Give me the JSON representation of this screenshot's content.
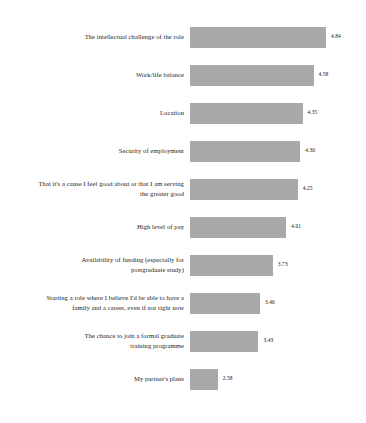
{
  "chart_data": {
    "type": "bar",
    "orientation": "horizontal",
    "title": "",
    "subtitle": "",
    "xlabel": "",
    "ylabel": "",
    "grid": false,
    "legend": null,
    "axis_visible": false,
    "tick_labels": [],
    "value_label_format": "2dp",
    "xlim": [
      2.0,
      5.0
    ],
    "bar_color": "#a9a9a9",
    "label_color": "#1c1c1c",
    "value_color": "#111111",
    "background": "#ffffff",
    "categories": [
      "The intellectual challenge of the role",
      "Work/life balance",
      "Location",
      "Security of employment",
      "That it's a cause I feel good about or that I am serving\nthe greater good",
      "High level of pay",
      "Availability of funding (especially for\npostgraduate study)",
      "Starting a role where I believe I'd be able to have a\nfamily and a career, even if not right now",
      "The chance to join a formal graduate\ntraining programme",
      "My partner's plans"
    ],
    "values": [
      4.84,
      4.58,
      4.35,
      4.3,
      4.25,
      4.01,
      3.73,
      3.46,
      3.43,
      2.58
    ],
    "value_labels": [
      "4.84",
      "4.58",
      "4.35",
      "4.30",
      "4.25",
      "4.01",
      "3.73",
      "3.46",
      "3.43",
      "2.58"
    ],
    "bars": [
      {
        "label": "The intellectual challenge of the role",
        "value": 4.84,
        "value_label": "4.84"
      },
      {
        "label": "Work/life balance",
        "value": 4.58,
        "value_label": "4.58"
      },
      {
        "label": "Location",
        "value": 4.35,
        "value_label": "4.35"
      },
      {
        "label": "Security of employment",
        "value": 4.3,
        "value_label": "4.30"
      },
      {
        "label": "That it's a cause I feel good about or that I am serving\nthe greater good",
        "value": 4.25,
        "value_label": "4.25"
      },
      {
        "label": "High level of pay",
        "value": 4.01,
        "value_label": "4.01"
      },
      {
        "label": "Availability of funding (especially for\npostgraduate study)",
        "value": 3.73,
        "value_label": "3.73"
      },
      {
        "label": "Starting a role where I believe I'd be able to have a\nfamily and a career, even if not right now",
        "value": 3.46,
        "value_label": "3.46"
      },
      {
        "label": "The chance to join a formal graduate\ntraining programme",
        "value": 3.43,
        "value_label": "3.43"
      },
      {
        "label": "My partner's plans",
        "value": 2.58,
        "value_label": "2.58"
      }
    ]
  }
}
